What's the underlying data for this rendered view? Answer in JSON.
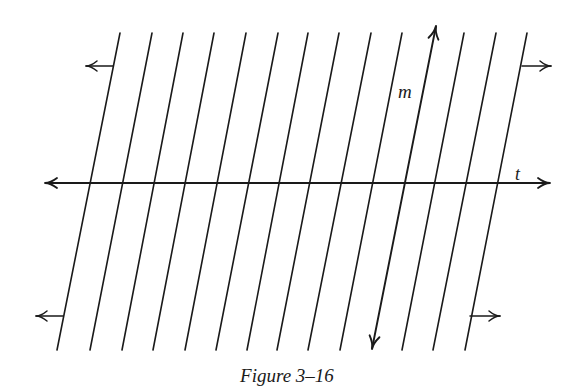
{
  "figure": {
    "caption": "Figure 3–16",
    "labels": {
      "m": "m",
      "t": "t"
    },
    "stroke_color": "#1a1a1a",
    "parallel_lines": {
      "count": 15,
      "top_y": 33,
      "bottom_y": 350,
      "top_x": [
        120,
        152,
        183,
        214,
        246,
        278,
        308,
        339,
        371,
        402,
        433,
        464,
        496,
        527
      ],
      "bottom_x": [
        57,
        90,
        122,
        153,
        185,
        216,
        247,
        277,
        308,
        340,
        372,
        402,
        433,
        465
      ]
    },
    "line_t": {
      "x1": 45,
      "y1": 183,
      "x2": 550,
      "y2": 183
    },
    "line_m": {
      "x1": 372,
      "y1": 349,
      "x2": 436,
      "y2": 26
    },
    "plane_arrows": [
      {
        "position": "top-left",
        "x_from": 113,
        "x_to": 86,
        "y": 66
      },
      {
        "position": "top-right",
        "x_from": 522,
        "x_to": 551,
        "y": 66
      },
      {
        "position": "bottom-left",
        "x_from": 63,
        "x_to": 36,
        "y": 316
      },
      {
        "position": "bottom-right",
        "x_from": 470,
        "x_to": 500,
        "y": 316
      }
    ]
  }
}
